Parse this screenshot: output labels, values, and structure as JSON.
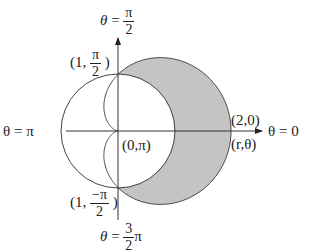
{
  "diagram": {
    "type": "polar-region",
    "origin_px": [
      118,
      131
    ],
    "unit_px": 56,
    "curves": [
      {
        "name": "unit-circle",
        "equation": "r = 1",
        "stroke": "#444444"
      },
      {
        "name": "cardioid",
        "equation": "r = 1 + cos(theta)",
        "stroke": "#444444"
      }
    ],
    "shaded_region": {
      "description": "inside cardioid, outside circle",
      "fill": "#c4c4c4"
    },
    "axes": {
      "top": {
        "theta": "θ",
        "eq": "=",
        "num": "π",
        "den": "2"
      },
      "left": {
        "text": "θ = π"
      },
      "right": {
        "text": "θ =  0"
      },
      "bottom": {
        "theta": "θ",
        "eq": "=",
        "num": "3",
        "den": "2",
        "suffix": "π"
      }
    },
    "points": {
      "top": {
        "open": "(1,",
        "num": "π",
        "den": "2",
        "close": ")"
      },
      "bottom": {
        "open": "(1,",
        "num": "−π",
        "den": "2",
        "close": ")"
      },
      "origin": "(0,π)",
      "right_upper": "(2,0)",
      "right_lower": "(r,θ)"
    }
  }
}
